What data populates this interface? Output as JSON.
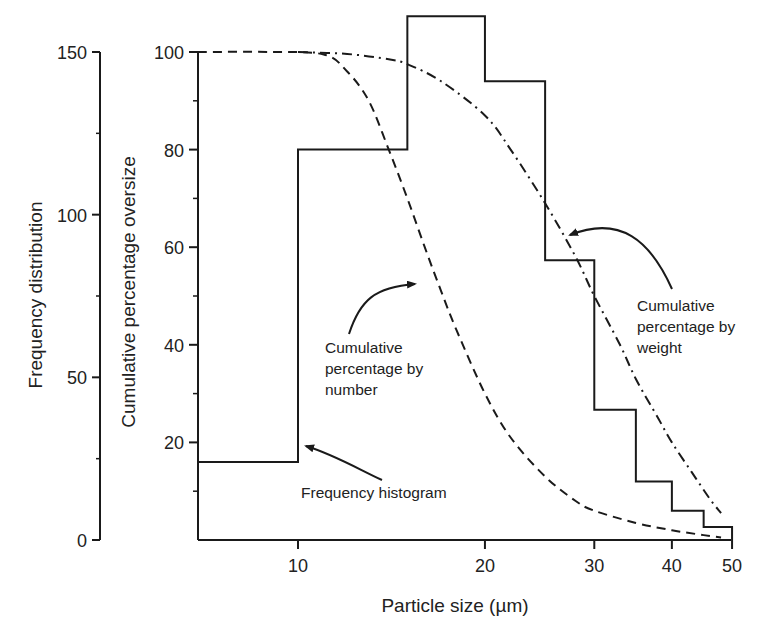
{
  "chart_data": {
    "type": "bar",
    "subtype": "histogram-with-cumulative-lines",
    "title": "",
    "xlabel": "Particle size (µm)",
    "x_scale": "log",
    "x_ticks": [
      10,
      20,
      30,
      40,
      50
    ],
    "x_range": [
      6.9,
      50
    ],
    "y_axes": [
      {
        "id": "frequency",
        "label": "Frequency distribution",
        "ticks": [
          0,
          50,
          100,
          150
        ],
        "minor_ticks": [
          25,
          75,
          125
        ],
        "range": [
          0,
          150
        ]
      },
      {
        "id": "cumulative",
        "label": "Cumulative percentage oversize",
        "ticks": [
          20,
          40,
          60,
          80,
          100
        ],
        "minor_ticks": [
          10,
          30,
          50,
          70,
          90
        ],
        "range": [
          0,
          100
        ]
      }
    ],
    "series": [
      {
        "name": "Frequency histogram",
        "axis": "frequency",
        "style": "solid-step",
        "bins": [
          {
            "from": 6.9,
            "to": 10,
            "value": 24
          },
          {
            "from": 10,
            "to": 15,
            "value": 120
          },
          {
            "from": 15,
            "to": 20,
            "value": 161
          },
          {
            "from": 20,
            "to": 25,
            "value": 141
          },
          {
            "from": 25,
            "to": 30,
            "value": 86
          },
          {
            "from": 30,
            "to": 35,
            "value": 40
          },
          {
            "from": 35,
            "to": 40,
            "value": 18
          },
          {
            "from": 40,
            "to": 45,
            "value": 9
          },
          {
            "from": 45,
            "to": 50,
            "value": 4
          }
        ]
      },
      {
        "name": "Cumulative percentage by number",
        "axis": "cumulative",
        "style": "dashed",
        "x": [
          6.9,
          9,
          11,
          12,
          13,
          14,
          15,
          16,
          17,
          18,
          20,
          22,
          25,
          28,
          30,
          35,
          40,
          45,
          48
        ],
        "values": [
          100,
          100,
          99.5,
          96,
          90,
          80,
          70,
          60,
          51,
          43,
          30,
          21,
          13,
          8,
          6,
          3.5,
          2,
          1,
          0.5
        ]
      },
      {
        "name": "Cumulative percentage by weight",
        "axis": "cumulative",
        "style": "dash-dot",
        "x": [
          10,
          12,
          14,
          15,
          17,
          20,
          22,
          25,
          28,
          30,
          33,
          35,
          38,
          40,
          43,
          46,
          48
        ],
        "values": [
          100,
          99.6,
          98.5,
          97.5,
          94,
          87,
          80,
          69,
          58,
          50,
          40,
          33,
          25,
          20,
          14,
          8.5,
          5.5
        ]
      }
    ],
    "annotations": [
      {
        "text_lines": [
          "Frequency histogram"
        ],
        "points_to": "Frequency histogram"
      },
      {
        "text_lines": [
          "Cumulative",
          "percentage by",
          "number"
        ],
        "points_to": "Cumulative percentage by number"
      },
      {
        "text_lines": [
          "Cumulative",
          "percentage by",
          "weight"
        ],
        "points_to": "Cumulative percentage by weight"
      }
    ],
    "grid": false,
    "legend": "none (inline annotations with arrows)"
  },
  "labels": {
    "x_axis_title": "Particle size (",
    "x_axis_unit": "µm",
    "x_axis_close": ")",
    "freq_axis_title": "Frequency distribution",
    "cum_axis_title": "Cumulative percentage oversize",
    "annot_hist": "Frequency histogram",
    "annot_number": [
      "Cumulative",
      "percentage by",
      "number"
    ],
    "annot_weight": [
      "Cumulative",
      "percentage by",
      "weight"
    ]
  },
  "colors": {
    "ink": "#1a1a1a",
    "background": "#ffffff"
  }
}
